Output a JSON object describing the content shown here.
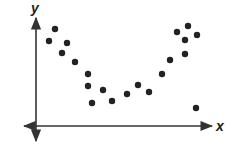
{
  "chart_data": {
    "type": "scatter",
    "title": "",
    "xlabel": "x",
    "ylabel": "y",
    "grid": false,
    "legend": null,
    "axis_style": "arrowed axes, no ticks or tick labels",
    "points_px": [
      [
        49,
        41
      ],
      [
        55,
        29
      ],
      [
        62,
        53
      ],
      [
        67,
        43
      ],
      [
        75,
        62
      ],
      [
        88,
        74
      ],
      [
        88,
        86
      ],
      [
        92,
        103
      ],
      [
        103,
        90
      ],
      [
        112,
        101
      ],
      [
        127,
        94
      ],
      [
        138,
        85
      ],
      [
        149,
        92
      ],
      [
        162,
        74
      ],
      [
        170,
        60
      ],
      [
        177,
        32
      ],
      [
        185,
        40
      ],
      [
        185,
        54
      ],
      [
        188,
        26
      ],
      [
        197,
        35
      ],
      [
        196,
        108
      ]
    ],
    "colors": {
      "points": "#222222",
      "axes": "#333333"
    }
  },
  "labels": {
    "x": "x",
    "y": "y"
  }
}
